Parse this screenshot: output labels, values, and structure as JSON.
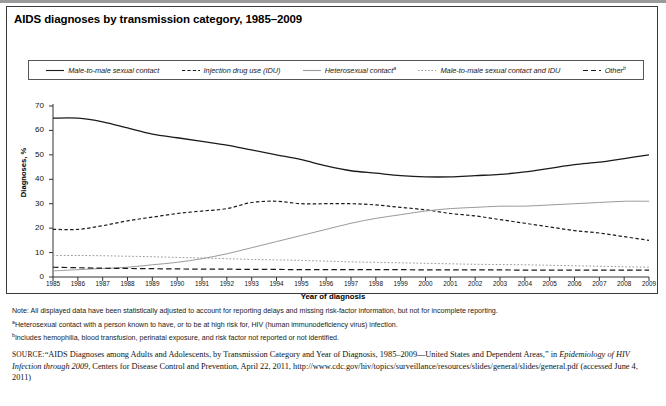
{
  "figure": {
    "title": "AIDS diagnoses by transmission category, 1985–2009"
  },
  "chart_data": {
    "type": "line",
    "title": "AIDS diagnoses by transmission category, 1985–2009",
    "xlabel": "Year of diagnosis",
    "ylabel": "Diagnoses, %",
    "xlim": [
      1985,
      2009
    ],
    "ylim": [
      0,
      70
    ],
    "yticks": [
      0,
      10,
      20,
      30,
      40,
      50,
      60,
      70
    ],
    "grid": false,
    "legend_position": "top",
    "categories": [
      1985,
      1986,
      1987,
      1988,
      1989,
      1990,
      1991,
      1992,
      1993,
      1994,
      1995,
      1996,
      1997,
      1998,
      1999,
      2000,
      2001,
      2002,
      2003,
      2004,
      2005,
      2006,
      2007,
      2008,
      2009
    ],
    "series": [
      {
        "name": "Male-to-male sexual contact",
        "style": "solid",
        "color": "#1a1a1a",
        "values": [
          65.0,
          65.0,
          63.5,
          61.0,
          58.5,
          57.0,
          55.5,
          54.0,
          52.0,
          50.0,
          48.0,
          45.5,
          43.5,
          42.5,
          41.5,
          41.0,
          41.0,
          41.5,
          42.0,
          43.0,
          44.5,
          46.0,
          47.0,
          48.5,
          50.0
        ]
      },
      {
        "name": "Injection drug use (IDU)",
        "style": "dashed",
        "color": "#1a1a1a",
        "values": [
          19.5,
          19.5,
          21.0,
          23.0,
          24.5,
          26.0,
          27.0,
          28.0,
          30.5,
          31.0,
          30.0,
          30.0,
          30.0,
          29.5,
          28.5,
          27.5,
          26.0,
          25.0,
          23.5,
          22.0,
          20.5,
          19.0,
          18.0,
          16.5,
          15.0
        ]
      },
      {
        "name": "Heterosexual contact",
        "footnote": "a",
        "style": "solid-light",
        "color": "#9a9a9a",
        "values": [
          2.5,
          3.0,
          3.5,
          4.0,
          5.0,
          6.0,
          7.5,
          9.5,
          12.0,
          14.5,
          17.0,
          19.5,
          22.0,
          24.0,
          25.5,
          27.0,
          28.0,
          28.5,
          29.0,
          29.0,
          29.5,
          30.0,
          30.5,
          31.0,
          31.0
        ]
      },
      {
        "name": "Male-to-male sexual contact and IDU",
        "style": "dotted",
        "color": "#9a9a9a",
        "values": [
          8.8,
          8.8,
          8.7,
          8.5,
          8.3,
          8.0,
          7.8,
          7.5,
          7.2,
          7.0,
          6.8,
          6.5,
          6.2,
          6.0,
          5.8,
          5.6,
          5.4,
          5.2,
          5.1,
          5.0,
          4.8,
          4.6,
          4.4,
          4.2,
          4.0
        ]
      },
      {
        "name": "Other",
        "footnote": "b",
        "style": "longdash",
        "color": "#1a1a1a",
        "values": [
          4.0,
          3.8,
          3.6,
          3.5,
          3.4,
          3.3,
          3.2,
          3.2,
          3.1,
          3.1,
          3.0,
          3.0,
          3.0,
          3.0,
          3.0,
          2.9,
          2.9,
          2.9,
          2.9,
          2.8,
          2.8,
          2.8,
          2.8,
          2.8,
          2.8
        ]
      }
    ]
  },
  "legend": [
    {
      "label": "Male-to-male sexual contact",
      "sup": ""
    },
    {
      "label": "Injection drug use (IDU)",
      "sup": ""
    },
    {
      "label": "Heterosexual contact",
      "sup": "a"
    },
    {
      "label": "Male-to-male sexual contact and IDU",
      "sup": ""
    },
    {
      "label": "Other",
      "sup": "b"
    }
  ],
  "notes": {
    "note": "Note: All displayed data have been statistically adjusted to account for reporting delays and missing risk-factor information, but not for incomplete reporting.",
    "footnote_a_sup": "a",
    "footnote_a": "Heterosexual contact with a person known to have, or to be at high risk for, HIV (human immunodeficiency virus) infection.",
    "footnote_b_sup": "b",
    "footnote_b": "Includes hemophilia, blood transfusion, perinatal exposure, and risk factor not reported or not identified."
  },
  "source": {
    "label": "SOURCE:",
    "part1": "“AIDS Diagnoses among Adults and Adolescents, by Transmission Category and Year of Diagnosis, 1985–2009—United States and Dependent Areas,” in ",
    "italic": "Epidemiology of HIV Infection through 2009",
    "part2": ", Centers for Disease Control and Prevention, April 22, 2011, http://www.cdc.gov/hiv/topics/surveillance/resources/slides/general/slides/general.pdf (accessed June 4, 2011)"
  }
}
